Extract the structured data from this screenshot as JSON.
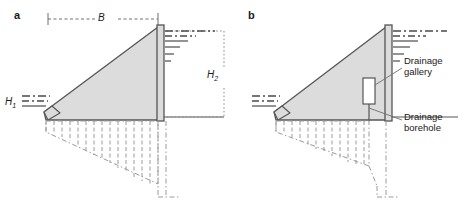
{
  "figure": {
    "width": 467,
    "height": 212,
    "background": "#ffffff"
  },
  "colors": {
    "dam_fill": "#dcdcdc",
    "dam_outline": "#555555",
    "line": "#6e6e6e",
    "text": "#1a1a1a",
    "gallery_fill": "#ffffff"
  },
  "panels": [
    {
      "id": "a",
      "letter": "a",
      "labels": {
        "base_width": "B",
        "upstream_head_h": "H",
        "upstream_head_sub": "1",
        "downstream_head_h": "H",
        "downstream_head_sub": "2"
      }
    },
    {
      "id": "b",
      "letter": "b",
      "callouts": [
        {
          "name": "drainage-gallery",
          "line1": "Drainage",
          "line2": "gallery"
        },
        {
          "name": "drainage-borehole",
          "line1": "Drainage",
          "line2": "borehole"
        }
      ]
    }
  ]
}
